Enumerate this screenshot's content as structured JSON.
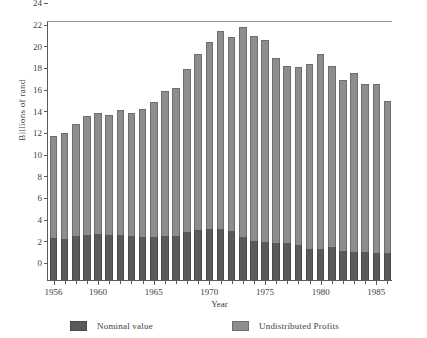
{
  "chart_data": {
    "type": "bar",
    "stacked": true,
    "title": "",
    "xlabel": "Year",
    "ylabel": "Billions of rand",
    "ylim": [
      0,
      24
    ],
    "ytick_values": [
      0,
      2,
      4,
      6,
      8,
      10,
      12,
      14,
      16,
      18,
      20,
      22,
      24
    ],
    "ytick_labels": [
      "0",
      "2",
      "4",
      "6",
      "8",
      "10",
      "12",
      "14",
      "16",
      "18",
      "20",
      "22",
      "24"
    ],
    "grid": false,
    "legend_position": "bottom",
    "categories": [
      "1956",
      "1957",
      "1958",
      "1959",
      "1960",
      "1961",
      "1962",
      "1963",
      "1964",
      "1965",
      "1966",
      "1967",
      "1968",
      "1969",
      "1970",
      "1971",
      "1972",
      "1973",
      "1974",
      "1975",
      "1976",
      "1977",
      "1978",
      "1979",
      "1980",
      "1981",
      "1982",
      "1983",
      "1984",
      "1985",
      "1986"
    ],
    "xtick_labels": [
      "1956",
      "1960",
      "1965",
      "1970",
      "1975",
      "1980",
      "1985"
    ],
    "xtick_label_years": [
      1956,
      1960,
      1965,
      1970,
      1975,
      1980,
      1985
    ],
    "series": [
      {
        "name": "Nominal value",
        "color": "#5a5a5a",
        "values": [
          3.85,
          3.8,
          4.05,
          4.2,
          4.25,
          4.2,
          4.15,
          4.1,
          3.95,
          3.95,
          4.05,
          4.1,
          4.45,
          4.6,
          4.75,
          4.75,
          4.5,
          3.95,
          3.6,
          3.55,
          3.4,
          3.4,
          3.2,
          2.85,
          2.85,
          3.05,
          2.7,
          2.6,
          2.55,
          2.5,
          2.5
        ]
      },
      {
        "name": "Undistributed Profits",
        "color": "#8d8d8d",
        "values": [
          9.45,
          9.8,
          10.35,
          10.9,
          11.2,
          11.05,
          11.55,
          11.35,
          11.85,
          12.5,
          13.4,
          13.6,
          15.0,
          16.25,
          17.2,
          18.2,
          17.9,
          19.45,
          18.9,
          18.6,
          17.1,
          16.35,
          16.45,
          17.1,
          18.0,
          16.75,
          15.8,
          16.5,
          15.55,
          15.55,
          14.05
        ]
      }
    ],
    "totals": [
      13.3,
      13.6,
      14.4,
      15.1,
      15.45,
      15.25,
      15.7,
      15.45,
      15.8,
      16.45,
      17.45,
      17.7,
      19.45,
      20.85,
      21.95,
      22.95,
      22.4,
      23.4,
      22.5,
      22.15,
      20.5,
      19.75,
      19.65,
      19.95,
      20.85,
      19.8,
      18.5,
      19.1,
      18.1,
      18.05,
      16.55
    ]
  },
  "legend": {
    "nominal_label": "Nominal value",
    "undistributed_label": "Undistributed Profits"
  },
  "axes": {
    "x_title": "Year",
    "y_title": "Billions of rand"
  }
}
